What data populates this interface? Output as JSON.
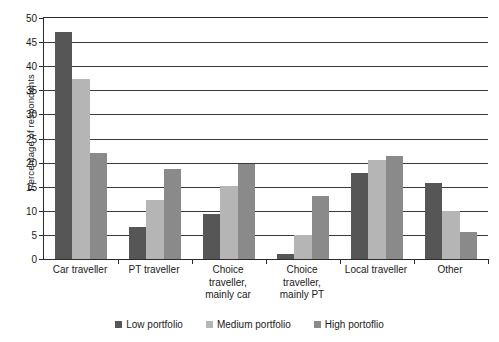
{
  "chart_data": {
    "type": "bar",
    "title": "",
    "xlabel": "",
    "ylabel": "Percentage of respondents",
    "ylim": [
      0,
      50
    ],
    "ytick_step": 5,
    "yticks": [
      0,
      5,
      10,
      15,
      20,
      25,
      30,
      35,
      40,
      45,
      50
    ],
    "grid": true,
    "legend_position": "bottom",
    "categories": [
      "Car traveller",
      "PT traveller",
      "Choice traveller, mainly car",
      "Choice traveller, mainly PT",
      "Local traveller",
      "Other"
    ],
    "category_lines": [
      [
        "Car traveller"
      ],
      [
        "PT traveller"
      ],
      [
        "Choice",
        "traveller,",
        "mainly car"
      ],
      [
        "Choice",
        "traveller,",
        "mainly PT"
      ],
      [
        "Local traveller"
      ],
      [
        "Other"
      ]
    ],
    "series": [
      {
        "name": "Low portfolio",
        "color": "#565656",
        "values": [
          47.0,
          6.7,
          9.4,
          1.0,
          17.8,
          15.7
        ]
      },
      {
        "name": "Medium portfolio",
        "color": "#b5b5b5",
        "values": [
          37.3,
          12.3,
          15.2,
          5.0,
          20.6,
          10.0
        ]
      },
      {
        "name": "High portoflio",
        "color": "#8a8a8a",
        "values": [
          22.0,
          18.7,
          19.7,
          13.0,
          21.4,
          5.6
        ]
      }
    ]
  },
  "axis": {
    "y_title": "Percentage of respondents"
  },
  "legend": {
    "items": [
      {
        "label": "Low portfolio",
        "color": "#565656"
      },
      {
        "label": "Medium portfolio",
        "color": "#b5b5b5"
      },
      {
        "label": "High portoflio",
        "color": "#8a8a8a"
      }
    ]
  },
  "style": {
    "axis_color": "#2b2b2b",
    "grid_color": "#3a3a3a",
    "background": "#ffffff",
    "text_color": "#1a1a1a"
  }
}
